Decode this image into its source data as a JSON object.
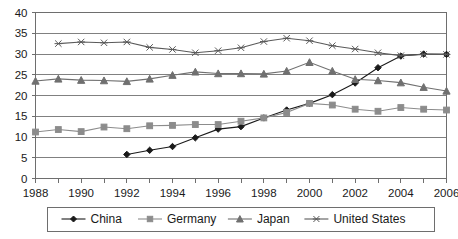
{
  "chart_data": {
    "type": "line",
    "title": "",
    "subtitle": "",
    "xlabel": "",
    "ylabel": "",
    "xlim": [
      1988,
      2006
    ],
    "ylim": [
      0,
      40
    ],
    "yticks": [
      0,
      5,
      10,
      15,
      20,
      25,
      30,
      35,
      40
    ],
    "xticks": [
      1988,
      1989,
      1990,
      1991,
      1992,
      1993,
      1994,
      1995,
      1996,
      1997,
      1998,
      1999,
      2000,
      2001,
      2002,
      2003,
      2004,
      2005,
      2006
    ],
    "xtick_labels_shown": [
      1988,
      1990,
      1992,
      1994,
      1996,
      1998,
      2000,
      2002,
      2004,
      2006
    ],
    "grid": "horizontal",
    "legend_position": "bottom",
    "x": [
      1988,
      1989,
      1990,
      1991,
      1992,
      1993,
      1994,
      1995,
      1996,
      1997,
      1998,
      1999,
      2000,
      2001,
      2002,
      2003,
      2004,
      2005,
      2006
    ],
    "series": [
      {
        "name": "China",
        "marker": "diamond",
        "color": "#1a1a1a",
        "x": [
          1992,
          1993,
          1994,
          1995,
          1996,
          1997,
          1998,
          1999,
          2000,
          2001,
          2002,
          2003,
          2004,
          2005,
          2006
        ],
        "values": [
          5.8,
          6.8,
          7.7,
          9.8,
          11.9,
          12.5,
          14.6,
          16.5,
          18.1,
          20.2,
          23.0,
          26.7,
          29.5,
          30.0,
          29.9
        ]
      },
      {
        "name": "Germany",
        "marker": "square",
        "color": "#8c8c8c",
        "x": [
          1988,
          1989,
          1990,
          1991,
          1992,
          1993,
          1994,
          1995,
          1996,
          1997,
          1998,
          1999,
          2000,
          2001,
          2002,
          2003,
          2004,
          2005,
          2006
        ],
        "values": [
          11.2,
          11.8,
          11.3,
          12.4,
          12.0,
          12.7,
          12.8,
          13.0,
          13.0,
          13.8,
          14.6,
          15.9,
          18.1,
          17.7,
          16.7,
          16.2,
          17.1,
          16.7,
          16.5
        ]
      },
      {
        "name": "Japan",
        "marker": "triangle",
        "color": "#707070",
        "x": [
          1988,
          1989,
          1990,
          1991,
          1992,
          1993,
          1994,
          1995,
          1996,
          1997,
          1998,
          1999,
          2000,
          2001,
          2002,
          2003,
          2004,
          2005,
          2006
        ],
        "values": [
          23.5,
          24.0,
          23.7,
          23.6,
          23.4,
          24.0,
          24.9,
          25.7,
          25.3,
          25.3,
          25.2,
          25.9,
          28.0,
          25.9,
          23.9,
          23.6,
          23.1,
          22.0,
          21.1
        ]
      },
      {
        "name": "United States",
        "marker": "x",
        "color": "#5a5a5a",
        "x": [
          1989,
          1990,
          1991,
          1992,
          1993,
          1994,
          1995,
          1996,
          1997,
          1998,
          1999,
          2000,
          2001,
          2002,
          2003,
          2004,
          2005,
          2006
        ],
        "values": [
          32.5,
          32.9,
          32.7,
          32.9,
          31.6,
          31.1,
          30.3,
          30.8,
          31.5,
          33.0,
          33.8,
          33.2,
          32.0,
          31.2,
          30.3,
          29.6,
          29.9,
          29.9
        ]
      }
    ]
  },
  "legend": {
    "items": [
      {
        "label": "China"
      },
      {
        "label": "Germany"
      },
      {
        "label": "Japan"
      },
      {
        "label": "United States"
      }
    ]
  }
}
